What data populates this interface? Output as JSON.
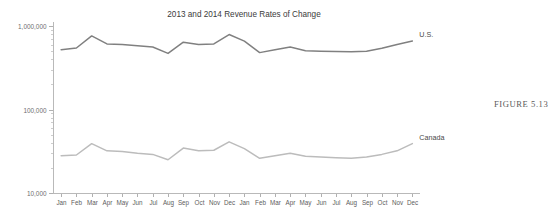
{
  "figure": {
    "caption": "FIGURE 5.13"
  },
  "chart_data": {
    "type": "line",
    "title": "2013 and 2014 Revenue Rates of Change",
    "xlabel": "",
    "ylabel": "",
    "yscale": "log",
    "ylim": [
      10000,
      1000000
    ],
    "ytick_labels": [
      "1,000,000",
      "100,000",
      "10,000"
    ],
    "ytick_values": [
      1000000,
      100000,
      10000
    ],
    "grid": false,
    "legend": "inline-right-end-labels",
    "categories": [
      "Jan",
      "Feb",
      "Mar",
      "Apr",
      "May",
      "Jun",
      "Jul",
      "Aug",
      "Sep",
      "Oct",
      "Nov",
      "Dec",
      "Jan",
      "Feb",
      "Mar",
      "Apr",
      "May",
      "Jun",
      "Jul",
      "Aug",
      "Sep",
      "Oct",
      "Nov",
      "Dec"
    ],
    "series": [
      {
        "name": "U.S.",
        "color": "#808080",
        "values": [
          520000,
          545000,
          760000,
          610000,
          600000,
          580000,
          560000,
          470000,
          640000,
          600000,
          610000,
          790000,
          660000,
          480000,
          520000,
          560000,
          505000,
          500000,
          495000,
          490000,
          500000,
          540000,
          600000,
          660000
        ]
      },
      {
        "name": "Canada",
        "color": "#bcbcbc",
        "values": [
          28000,
          28500,
          39000,
          32000,
          31500,
          30000,
          29000,
          25000,
          34500,
          32000,
          32500,
          41000,
          34000,
          26000,
          28000,
          30000,
          27500,
          27000,
          26500,
          26000,
          27000,
          29000,
          32000,
          39000
        ]
      }
    ]
  }
}
